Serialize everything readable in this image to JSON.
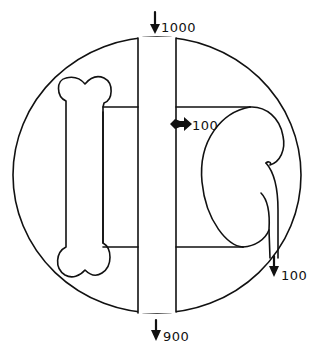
{
  "diagram": {
    "title": "",
    "labels": {
      "inflow_top": "1000",
      "transfer_to_kidney": "100",
      "kidney_outflow": "100",
      "outflow_bottom": "900"
    },
    "components": [
      {
        "name": "body-compartment",
        "shape": "circle"
      },
      {
        "name": "central-tube",
        "shape": "vertical channel"
      },
      {
        "name": "bone",
        "shape": "bone"
      },
      {
        "name": "left-chamber",
        "shape": "rectangle"
      },
      {
        "name": "right-chamber",
        "shape": "rectangle"
      },
      {
        "name": "kidney",
        "shape": "kidney"
      },
      {
        "name": "ureter",
        "shape": "tube"
      }
    ],
    "colors": {
      "stroke": "#111111",
      "background": "#ffffff"
    }
  }
}
